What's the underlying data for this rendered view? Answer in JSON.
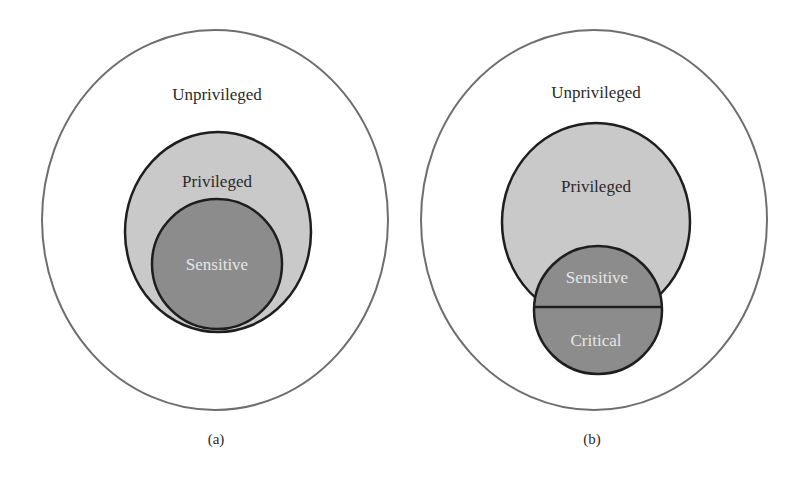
{
  "colors": {
    "background": "#ffffff",
    "outer_stroke": "#6e6e6e",
    "inner_stroke": "#1e1e1e",
    "privileged_fill": "#c9c9c9",
    "sensitive_fill": "#8c8c8c",
    "dark_text": "#2a2a2a",
    "light_text": "#e6e6e6"
  },
  "panels": [
    {
      "caption": "(a)",
      "regions": {
        "outer": "Unprivileged",
        "middle": "Privileged",
        "inner": "Sensitive"
      }
    },
    {
      "caption": "(b)",
      "regions": {
        "outer": "Unprivileged",
        "middle": "Privileged",
        "inner_top": "Sensitive",
        "inner_bottom": "Critical"
      }
    }
  ]
}
